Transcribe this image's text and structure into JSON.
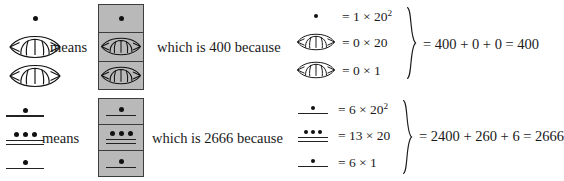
{
  "figure": {
    "kind": "mayan-numeral-explanation",
    "connector_means": "means",
    "rows": [
      {
        "id": "row-400",
        "value_text": "which is 400 because",
        "left_numeral": {
          "description": "vertical stack: dot over shell over shell",
          "places": [
            {
              "glyph": "dot",
              "dots": 1,
              "bars": 0
            },
            {
              "glyph": "shell",
              "dots": 0,
              "bars": 0
            },
            {
              "glyph": "shell",
              "dots": 0,
              "bars": 0
            }
          ]
        },
        "equations": [
          {
            "glyph": "dot",
            "text": "= 1 × 20",
            "exponent": "2"
          },
          {
            "glyph": "shell",
            "text": "= 0 × 20",
            "exponent": ""
          },
          {
            "glyph": "shell",
            "text": "= 0 × 1",
            "exponent": ""
          }
        ],
        "result": "= 400 + 0 + 0 = 400"
      },
      {
        "id": "row-2666",
        "value_text": "which is 2666 because",
        "left_numeral": {
          "description": "vertical stack: 1 dot over 1 bar; 3 dots over 2 bars; 1 dot over 1 bar",
          "places": [
            {
              "glyph": "dotbar",
              "dots": 1,
              "bars": 1
            },
            {
              "glyph": "dotbar",
              "dots": 3,
              "bars": 2
            },
            {
              "glyph": "dotbar",
              "dots": 1,
              "bars": 1
            }
          ]
        },
        "equations": [
          {
            "glyph": "dotbar-1-1",
            "text": "= 6 × 20",
            "exponent": "2"
          },
          {
            "glyph": "dotbar-3-2",
            "text": "= 13 × 20",
            "exponent": ""
          },
          {
            "glyph": "dotbar-1-1",
            "text": "= 6 × 1",
            "exponent": ""
          }
        ],
        "result": "= 2400 + 260 + 6 = 2666"
      }
    ]
  },
  "colors": {
    "ink": "#1a1a1a",
    "glyph": "#111111",
    "box_fill": "#b9b9b9",
    "box_border": "#3d3d3d",
    "page": "#ffffff"
  }
}
